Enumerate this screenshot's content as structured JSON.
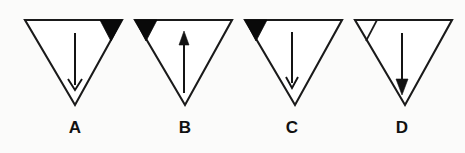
{
  "figure": {
    "background_color": "#fbfbfa",
    "line_color": "#1a1a1a",
    "fill_color": "#090909",
    "panel_count": 4,
    "panels": [
      {
        "label": "A",
        "shape": "inverted-triangle",
        "arrow_direction": "down",
        "arrow_head_style": "thin-open",
        "marker_corner": "top-right",
        "marker_fill": "filled-black",
        "marker_present": "yes"
      },
      {
        "label": "B",
        "shape": "inverted-triangle",
        "arrow_direction": "up",
        "arrow_head_style": "solid",
        "marker_corner": "top-left",
        "marker_fill": "filled-black",
        "marker_present": "yes"
      },
      {
        "label": "C",
        "shape": "inverted-triangle",
        "arrow_direction": "down",
        "arrow_head_style": "thin-open",
        "marker_corner": "top-left",
        "marker_fill": "filled-black",
        "marker_present": "yes"
      },
      {
        "label": "D",
        "shape": "inverted-triangle",
        "arrow_direction": "down",
        "arrow_head_style": "solid",
        "marker_corner": "top-left",
        "marker_fill": "outline-only",
        "marker_present": "yes"
      }
    ]
  }
}
